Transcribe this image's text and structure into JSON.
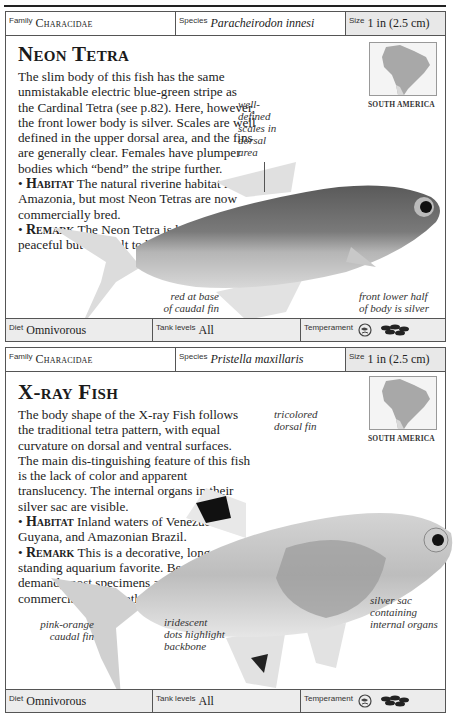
{
  "entries": [
    {
      "header": {
        "family_label": "Family",
        "family": "Characidae",
        "species_label": "Species",
        "species": "Paracheirodon innesi",
        "size_label": "Size",
        "size": "1 in (2.5 cm)"
      },
      "title": "Neon Tetra",
      "description": "The slim body of this fish has the same unmistakable electric blue-green stripe as the Cardinal Tetra (see p.82). Here, however, the front lower body is silver. Scales are well defined in the upper dorsal area, and the fins are generally clear. Females have plumper bodies which “bend” the stripe further.",
      "habitat_label": "Habitat",
      "habitat": "The natural riverine habitat is Amazonia, but most Neon Tetras are now commercially bred.",
      "remark_label": "Remark",
      "remark": "The Neon Tetra is hardy and peaceful but difficult to breed.",
      "map_label": "SOUTH AMERICA",
      "annotations": {
        "scales": "well-\ndefined\nscales in\ndorsal\narea",
        "caudal": "red at base\nof caudal fin",
        "silver": "front lower half\nof body is silver"
      },
      "footer": {
        "diet_label": "Diet",
        "diet": "Omnivorous",
        "tank_label": "Tank levels",
        "tank": "All",
        "temperament_label": "Temperament",
        "temperament_icons": [
          "peaceful-fish-icon",
          "shoaling-fish-icon"
        ]
      }
    },
    {
      "header": {
        "family_label": "Family",
        "family": "Characidae",
        "species_label": "Species",
        "species": "Pristella maxillaris",
        "size_label": "Size",
        "size": "1 in (2.5 cm)"
      },
      "title": "X-ray Fish",
      "description": "The body shape of the X-ray Fish follows the traditional tetra pattern, with equal curvature on dorsal and ventral surfaces. The main dis-tinguishing feature of this fish is the lack of color and apparent translucency. The internal organs in their silver sac are visible.",
      "habitat_label": "Habitat",
      "habitat": "Inland waters of Venezuela, Guyana, and Amazonian Brazil.",
      "remark_label": "Remark",
      "remark": "This is a decorative, long-standing aquarium favorite. Because of demand, most specimens are now commercially bred rather than caught wild.",
      "map_label": "SOUTH AMERICA",
      "annotations": {
        "dorsal": "tricolored\ndorsal fin",
        "caudal": "pink-orange\ncaudal fin",
        "dots": "iridescent\ndots highlight\nbackbone",
        "sac": "silver sac\ncontaining\ninternal organs"
      },
      "footer": {
        "diet_label": "Diet",
        "diet": "Omnivorous",
        "tank_label": "Tank levels",
        "tank": "All",
        "temperament_label": "Temperament",
        "temperament_icons": [
          "peaceful-fish-icon",
          "shoaling-fish-icon"
        ]
      }
    }
  ]
}
